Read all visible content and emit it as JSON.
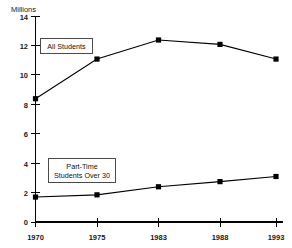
{
  "chart_data": {
    "type": "line",
    "title": "",
    "xlabel": "",
    "ylabel": "Millions",
    "categories": [
      "1970",
      "1975",
      "1983",
      "1988",
      "1993"
    ],
    "x_tick_labels": [
      "1970",
      "1975",
      "1983",
      "1988",
      "1993"
    ],
    "y_tick_labels": [
      "0",
      "2",
      "4",
      "6",
      "8",
      "10",
      "12",
      "14"
    ],
    "y_ticks": [
      0,
      2,
      4,
      6,
      8,
      10,
      12,
      14
    ],
    "ylim": [
      0,
      14
    ],
    "grid": false,
    "legend_position": "inline-boxed-labels",
    "series": [
      {
        "name": "All Students",
        "values": [
          8.4,
          11.1,
          12.4,
          12.1,
          11.1
        ],
        "marker": "filled-square",
        "color": "#000000"
      },
      {
        "name": "Part-Time Students Over 30",
        "values": [
          1.7,
          1.85,
          2.4,
          2.75,
          3.1
        ],
        "marker": "filled-square",
        "color": "#000000"
      }
    ],
    "annotations": [
      {
        "text": "All Students",
        "lines": [
          "All Students"
        ]
      },
      {
        "text": "Part-Time Students Over 30",
        "lines": [
          "Part-Time",
          "Students Over 30"
        ]
      }
    ]
  },
  "axis": {
    "y_title": "Millions"
  },
  "labels": {
    "all_students": "All Students",
    "part_time_line1": "Part-Time",
    "part_time_line2": "Students Over 30"
  },
  "ticks": {
    "y": {
      "t14": "14",
      "t12": "12",
      "t10": "10",
      "t8": "8",
      "t6": "6",
      "t4": "4",
      "t2": "2",
      "t0": "0"
    },
    "x": {
      "x1970": "1970",
      "x1975": "1975",
      "x1983": "1983",
      "x1988": "1988",
      "x1993": "1993"
    }
  },
  "colors": {
    "line": "#000000",
    "text": "#1a1a1a",
    "box_border": "#4a4a4a",
    "background": "#ffffff"
  }
}
